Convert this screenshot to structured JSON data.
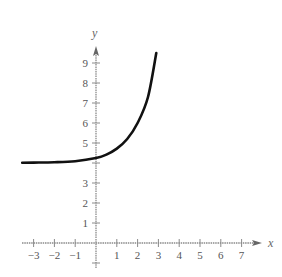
{
  "chart_data": {
    "type": "line",
    "title": "",
    "xlabel": "x",
    "ylabel": "y",
    "xlim": [
      -3.6,
      7.5
    ],
    "ylim": [
      -0.6,
      10
    ],
    "grid": false,
    "legend": null,
    "x_ticks": [
      -3,
      -2,
      -1,
      1,
      2,
      3,
      4,
      5,
      6,
      7
    ],
    "x_tick_labels": [
      "−3",
      "−2",
      "−1",
      "1",
      "2",
      "3",
      "4",
      "5",
      "6",
      "7"
    ],
    "y_ticks": [
      1,
      2,
      3,
      4,
      5,
      6,
      7,
      8,
      9
    ],
    "y_tick_labels": [
      "1",
      "2",
      "3",
      "",
      "5",
      "6",
      "7",
      "8",
      "9"
    ],
    "series": [
      {
        "name": "exponential curve",
        "description": "Exponential growth with horizontal asymptote y = 4",
        "x": [
          -3.55,
          -3,
          -2,
          -1,
          0,
          0.5,
          1,
          1.5,
          2,
          2.5,
          2.9
        ],
        "y": [
          4.01,
          4.02,
          4.04,
          4.09,
          4.25,
          4.42,
          4.72,
          5.2,
          6.0,
          7.3,
          9.5
        ]
      }
    ],
    "annotations": []
  },
  "header_fragment": "y   p   y"
}
